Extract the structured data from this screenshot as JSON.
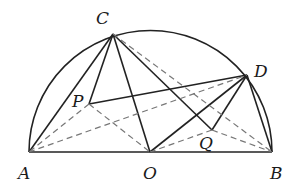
{
  "diagram": {
    "type": "semicircle-geometry",
    "points": {
      "A": {
        "label": "A",
        "x": 29,
        "y": 152
      },
      "B": {
        "label": "B",
        "x": 272,
        "y": 152
      },
      "O": {
        "label": "O",
        "x": 150,
        "y": 152
      },
      "C": {
        "label": "C",
        "x": 113,
        "y": 34
      },
      "D": {
        "label": "D",
        "x": 247,
        "y": 75
      },
      "P": {
        "label": "P",
        "x": 89,
        "y": 104
      },
      "Q": {
        "label": "Q",
        "x": 212,
        "y": 130
      }
    },
    "solid_segments": [
      [
        "A",
        "B"
      ],
      [
        "C",
        "A"
      ],
      [
        "C",
        "P"
      ],
      [
        "C",
        "O"
      ],
      [
        "C",
        "Q"
      ],
      [
        "P",
        "D"
      ],
      [
        "D",
        "O"
      ],
      [
        "D",
        "Q"
      ],
      [
        "D",
        "B"
      ]
    ],
    "dashed_segments": [
      [
        "C",
        "B"
      ],
      [
        "P",
        "A"
      ],
      [
        "P",
        "O"
      ],
      [
        "A",
        "D"
      ],
      [
        "Q",
        "O"
      ],
      [
        "Q",
        "B"
      ]
    ],
    "arc": {
      "center": "O",
      "from": "A",
      "to": "B"
    }
  }
}
